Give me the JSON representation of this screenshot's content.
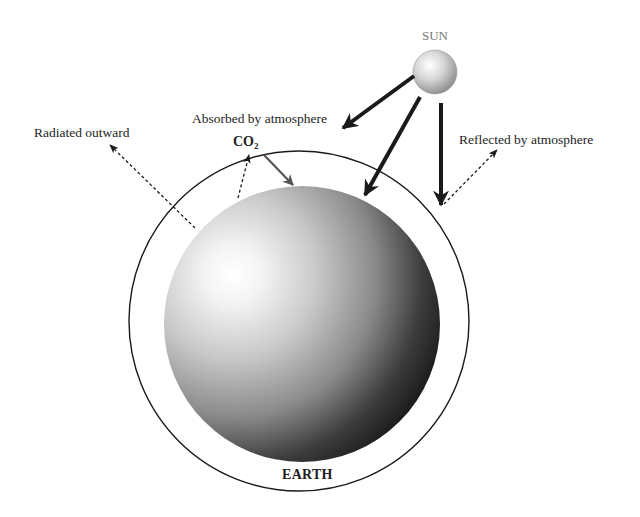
{
  "diagram": {
    "labels": {
      "sun": "SUN",
      "earth": "EARTH",
      "absorbed": "Absorbed by atmosphere",
      "radiated": "Radiated outward",
      "reflected": "Reflected by atmosphere",
      "co2_main": "CO",
      "co2_sub": "2"
    },
    "colors": {
      "background": "#ffffff",
      "line": "#1a1a1a",
      "co2_arrow": "#555555",
      "sun_label": "#7a7a7a",
      "text": "#1e1e1e"
    },
    "nodes": [
      {
        "id": "sun",
        "label": "SUN",
        "shape": "sphere",
        "cx": 435,
        "cy": 72,
        "r": 22
      },
      {
        "id": "earth",
        "label": "EARTH",
        "shape": "sphere",
        "cx": 302,
        "cy": 324,
        "r": 138
      },
      {
        "id": "atmosphere",
        "label": "",
        "shape": "circle-outline",
        "cx": 299,
        "cy": 321,
        "r": 170
      }
    ],
    "edges": [
      {
        "from": "sun",
        "to": "atmosphere",
        "label": "Absorbed by atmosphere",
        "style": "solid-thick"
      },
      {
        "from": "sun",
        "to": "earth",
        "label": "",
        "style": "solid-thick"
      },
      {
        "from": "sun",
        "to": "atmosphere",
        "label": "",
        "style": "solid-thick"
      },
      {
        "from": "atmosphere",
        "to": "space",
        "label": "Reflected by atmosphere",
        "style": "dashed"
      },
      {
        "from": "earth",
        "to": "space",
        "label": "Radiated outward",
        "style": "dashed"
      },
      {
        "from": "earth",
        "to": "atmosphere",
        "label": "CO2",
        "style": "dashed"
      },
      {
        "from": "atmosphere",
        "to": "earth",
        "label": "CO2",
        "style": "solid-grey"
      }
    ]
  }
}
